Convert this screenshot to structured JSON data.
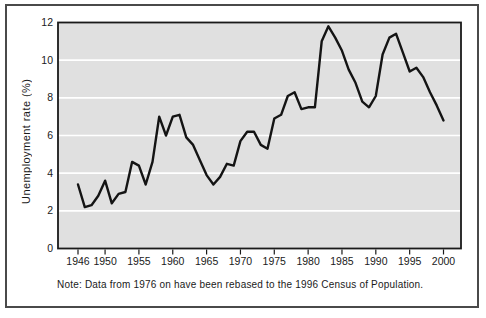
{
  "figure": {
    "y_axis_title": "Unemployment rate (%)",
    "note": "Note: Data from 1976 on have been rebased to the 1996 Census of Population."
  },
  "colors": {
    "page_bg": "#ffffff",
    "figure_border": "#4a4a4a",
    "plot_bg": "#e0e0e0",
    "gridline": "#ffffff",
    "axis_frame": "#1a1a1a",
    "data_line": "#141414",
    "text": "#1a1a1a"
  },
  "chart_data": {
    "type": "line",
    "title": "",
    "xlabel": "",
    "ylabel": "Unemployment rate (%)",
    "ylim": [
      0,
      12
    ],
    "yticks": [
      0,
      2,
      4,
      6,
      8,
      10,
      12
    ],
    "xticks": [
      1946,
      1950,
      1955,
      1960,
      1965,
      1970,
      1975,
      1980,
      1985,
      1990,
      1995,
      2000
    ],
    "grid": "horizontal white gridlines on gray plot background",
    "legend": "none",
    "note": "Note: Data from 1976 on have been rebased to the 1996 Census of Population.",
    "x": [
      1946,
      1947,
      1948,
      1949,
      1950,
      1951,
      1952,
      1953,
      1954,
      1955,
      1956,
      1957,
      1958,
      1959,
      1960,
      1961,
      1962,
      1963,
      1964,
      1965,
      1966,
      1967,
      1968,
      1969,
      1970,
      1971,
      1972,
      1973,
      1974,
      1975,
      1976,
      1977,
      1978,
      1979,
      1980,
      1981,
      1982,
      1983,
      1984,
      1985,
      1986,
      1987,
      1988,
      1989,
      1990,
      1991,
      1992,
      1993,
      1994,
      1995,
      1996,
      1997,
      1998,
      1999,
      2000
    ],
    "series": [
      {
        "name": "Unemployment rate (%)",
        "values": [
          3.4,
          2.2,
          2.3,
          2.8,
          3.6,
          2.4,
          2.9,
          3.0,
          4.6,
          4.4,
          3.4,
          4.6,
          7.0,
          6.0,
          7.0,
          7.1,
          5.9,
          5.5,
          4.7,
          3.9,
          3.4,
          3.8,
          4.5,
          4.4,
          5.7,
          6.2,
          6.2,
          5.5,
          5.3,
          6.9,
          7.1,
          8.1,
          8.3,
          7.4,
          7.5,
          7.5,
          11.0,
          11.8,
          11.2,
          10.5,
          9.5,
          8.8,
          7.8,
          7.5,
          8.1,
          10.3,
          11.2,
          11.4,
          10.4,
          9.4,
          9.6,
          9.1,
          8.3,
          7.6,
          6.8
        ]
      }
    ]
  }
}
